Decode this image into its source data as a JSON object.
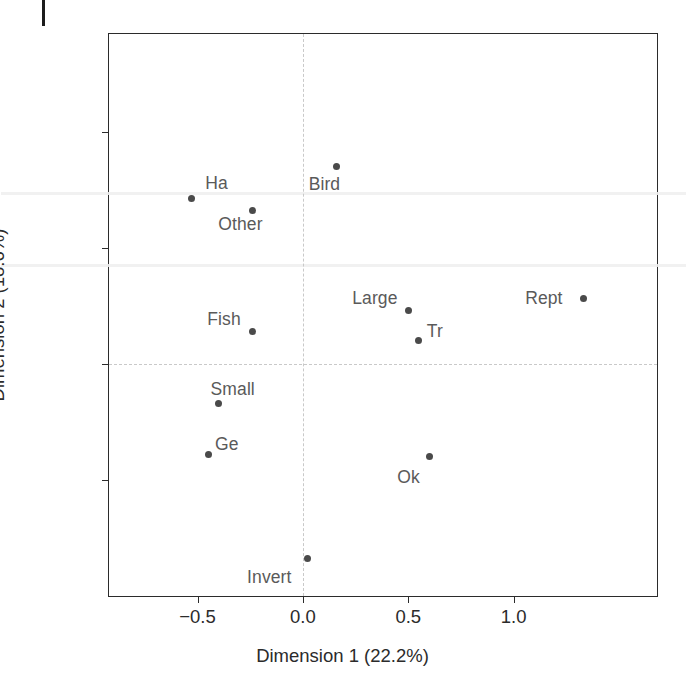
{
  "chart_data": {
    "type": "scatter",
    "title": "",
    "xlabel": "Dimension 1 (22.2%)",
    "ylabel": "Dimension 2 (18.6%)",
    "xlim": [
      -0.92,
      1.68
    ],
    "ylim": [
      -1.0,
      1.42
    ],
    "xticks": [
      -0.5,
      0.0,
      0.5,
      1.0
    ],
    "xtick_labels": [
      "−0.5",
      "0.0",
      "0.5",
      "1.0"
    ],
    "yticks": [
      1.0,
      0.5,
      0.0,
      -0.5
    ],
    "ytick_labels": [
      "1.0",
      "0.5",
      "0.0",
      "−0.5"
    ],
    "grid": false,
    "reference_lines": {
      "x": 0.0,
      "y": 0.0,
      "style": "dashed"
    },
    "legend": null,
    "point_color": "#4a4a4a",
    "label_color": "#5a5a5a",
    "points": [
      {
        "label": "Ha",
        "x": -0.53,
        "y": 0.71,
        "label_dx": 14,
        "label_dy": -26
      },
      {
        "label": "Other",
        "x": -0.24,
        "y": 0.66,
        "label_dx": -34,
        "label_dy": 4
      },
      {
        "label": "Bird",
        "x": 0.16,
        "y": 0.85,
        "label_dx": -28,
        "label_dy": 8
      },
      {
        "label": "Rept",
        "x": 1.33,
        "y": 0.28,
        "label_dx": -58,
        "label_dy": -11
      },
      {
        "label": "Large",
        "x": 0.5,
        "y": 0.23,
        "label_dx": -56,
        "label_dy": -22
      },
      {
        "label": "Tr",
        "x": 0.55,
        "y": 0.1,
        "label_dx": 8,
        "label_dy": -20
      },
      {
        "label": "Fish",
        "x": -0.24,
        "y": 0.14,
        "label_dx": -45,
        "label_dy": -22
      },
      {
        "label": "Small",
        "x": -0.4,
        "y": -0.17,
        "label_dx": -8,
        "label_dy": -24
      },
      {
        "label": "Ge",
        "x": -0.45,
        "y": -0.39,
        "label_dx": 7,
        "label_dy": -20
      },
      {
        "label": "Ok",
        "x": 0.6,
        "y": -0.4,
        "label_dx": -32,
        "label_dy": 10
      },
      {
        "label": "Invert",
        "x": 0.02,
        "y": -0.84,
        "label_dx": -60,
        "label_dy": 8
      }
    ]
  }
}
